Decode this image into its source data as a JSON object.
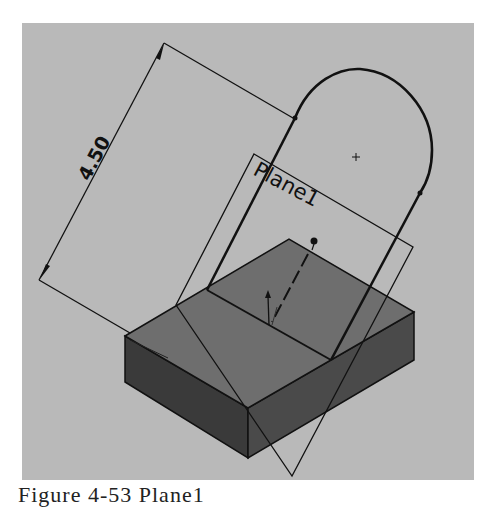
{
  "figure": {
    "caption": "Figure 4-53 Plane1",
    "background_color": "#b9b9b9"
  },
  "dimension": {
    "value": "4.50"
  },
  "plane": {
    "label": "Plane1"
  },
  "colors": {
    "line": "#111111",
    "box_top": "#6e6e6e",
    "box_front_left": "#3a3a3a",
    "box_front_right": "#4a4a4a"
  }
}
